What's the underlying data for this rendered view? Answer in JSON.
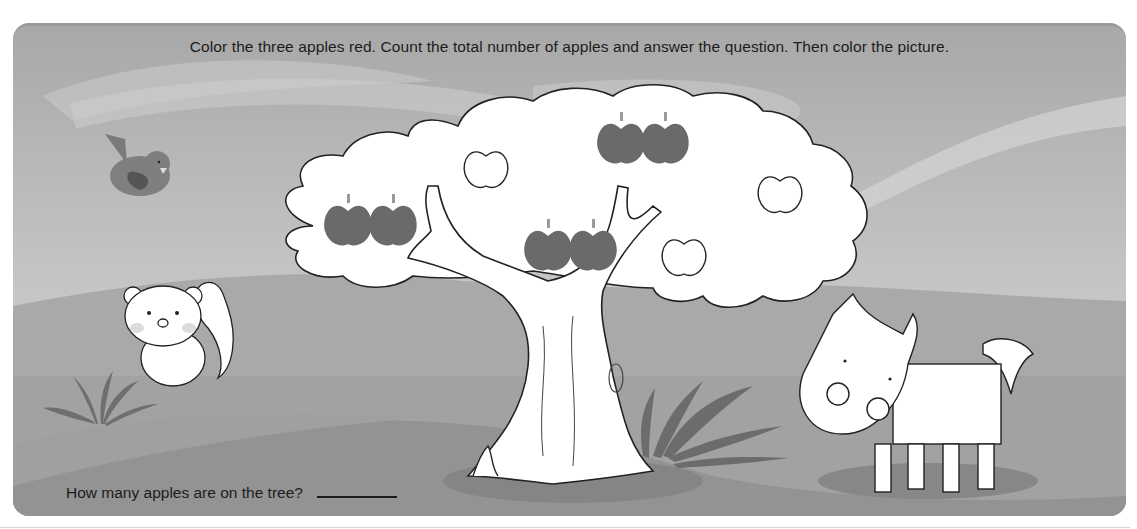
{
  "worksheet": {
    "instruction": "Color the three apples red. Count the total number of apples and answer the question. Then color the picture.",
    "question": "How many apples are on the tree?",
    "answer_value": ""
  },
  "scene": {
    "animals": [
      "bird",
      "squirrel",
      "horse"
    ],
    "tree": {
      "shaded_apples": 6,
      "outline_apples": 4
    }
  },
  "colors": {
    "panel_border": "#9a9a9a",
    "sky_top": "#a8a8a8",
    "hill_back": "#a9a9a9",
    "hill_front": "#9b9b9b",
    "apple_fill": "#6a6a6a",
    "text": "#1c1c1c"
  }
}
